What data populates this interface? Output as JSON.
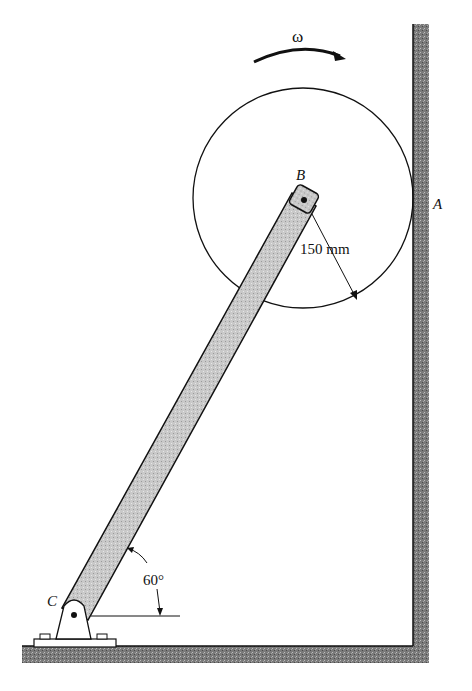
{
  "diagram": {
    "labels": {
      "omega": "ω",
      "point_b": "B",
      "point_a": "A",
      "point_c": "C",
      "radius": "150 mm",
      "angle": "60°"
    },
    "geometry": {
      "disk_radius_mm": 150,
      "rod_angle_deg": 60
    },
    "colors": {
      "line": "#111111",
      "hatch_fill": "#8a8a8a",
      "rod_fill": "#c8c8c8",
      "background": "#ffffff"
    }
  }
}
